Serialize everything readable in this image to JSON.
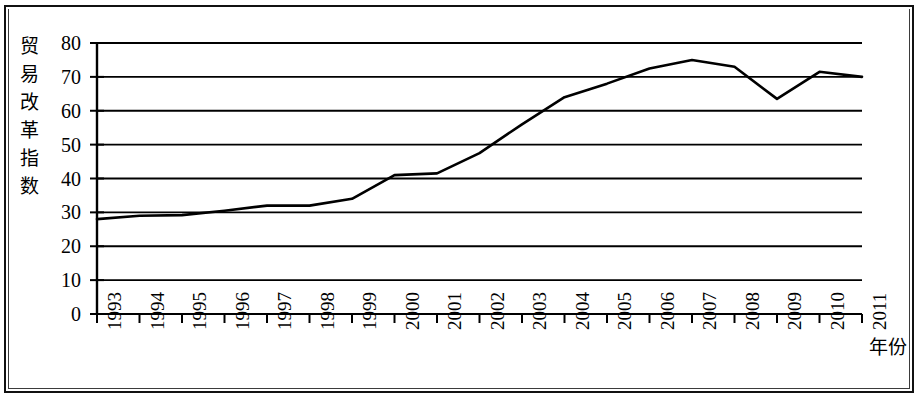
{
  "chart_data": {
    "type": "line",
    "title": "",
    "xlabel": "年份",
    "ylabel": "贸易改革指数",
    "ylabel_chars": [
      "贸",
      "易",
      "改",
      "革",
      "指",
      "数"
    ],
    "categories": [
      "1993",
      "1994",
      "1995",
      "1996",
      "1997",
      "1998",
      "1999",
      "2000",
      "2001",
      "2002",
      "2003",
      "2004",
      "2005",
      "2006",
      "2007",
      "2008",
      "2009",
      "2010",
      "2011"
    ],
    "values": [
      28,
      29,
      29.2,
      30.5,
      32,
      32,
      34,
      41,
      41.5,
      47.5,
      56,
      64,
      68,
      72.5,
      75,
      73,
      63.5,
      71.5,
      70
    ],
    "series": [
      {
        "name": "贸易改革指数",
        "values": [
          28,
          29,
          29.2,
          30.5,
          32,
          32,
          34,
          41,
          41.5,
          47.5,
          56,
          64,
          68,
          72.5,
          75,
          73,
          63.5,
          71.5,
          70
        ]
      }
    ],
    "yticks": [
      0,
      10,
      20,
      30,
      40,
      50,
      60,
      70,
      80
    ],
    "ytick_labels": [
      "0",
      "10",
      "20",
      "30",
      "40",
      "50",
      "60",
      "70",
      "80"
    ],
    "ylim": [
      0,
      80
    ],
    "xlim": [
      "1993",
      "2011"
    ],
    "grid": true,
    "grid_axis": "y",
    "legend": false,
    "legend_position": "none",
    "line_color": "#000000",
    "line_width": 2.6,
    "background_color": "#ffffff",
    "axis_color": "#000000",
    "markers": false,
    "xtick_rotation": 90
  },
  "figure": {
    "border_color": "#111111",
    "width": 921,
    "height": 400
  }
}
